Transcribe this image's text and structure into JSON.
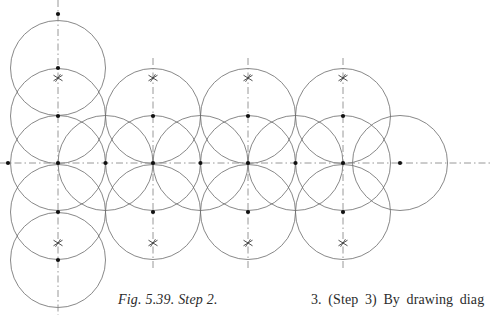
{
  "page": {
    "width": 491,
    "height": 322,
    "background": "#ffffff"
  },
  "figure": {
    "name": "compass-construction-hexagonal-circle-lattice",
    "caption": "Fig. 5.39. Step 2.",
    "stroke_color": "#6a6a6a",
    "construction_line_color": "#8c8c8c",
    "point_color": "#111111",
    "circle_radius": 47.5,
    "lattice": {
      "column_x": [
        58,
        105.5,
        153,
        200.5,
        248,
        295.5,
        343,
        400
      ],
      "row_y": [
        14,
        68,
        116,
        163,
        212,
        260,
        300
      ],
      "axis_y": 163,
      "col_spacing": 47.5,
      "row_spacing": 48
    },
    "circles": [
      {
        "cx": 58,
        "cy": 68,
        "r": 47.5
      },
      {
        "cx": 58,
        "cy": 116,
        "r": 47.5
      },
      {
        "cx": 58,
        "cy": 163,
        "r": 47.5
      },
      {
        "cx": 58,
        "cy": 212,
        "r": 47.5
      },
      {
        "cx": 58,
        "cy": 260,
        "r": 47.5
      },
      {
        "cx": 105.5,
        "cy": 163,
        "r": 47.5
      },
      {
        "cx": 153,
        "cy": 116,
        "r": 47.5
      },
      {
        "cx": 153,
        "cy": 163,
        "r": 47.5
      },
      {
        "cx": 153,
        "cy": 212,
        "r": 47.5
      },
      {
        "cx": 200.5,
        "cy": 163,
        "r": 47.5
      },
      {
        "cx": 248,
        "cy": 116,
        "r": 47.5
      },
      {
        "cx": 248,
        "cy": 163,
        "r": 47.5
      },
      {
        "cx": 248,
        "cy": 212,
        "r": 47.5
      },
      {
        "cx": 295.5,
        "cy": 163,
        "r": 47.5
      },
      {
        "cx": 343,
        "cy": 116,
        "r": 47.5
      },
      {
        "cx": 343,
        "cy": 163,
        "r": 47.5
      },
      {
        "cx": 343,
        "cy": 212,
        "r": 47.5
      },
      {
        "cx": 400,
        "cy": 163,
        "r": 47.5
      }
    ],
    "dash_dot_vertical_lines": [
      {
        "x": 58,
        "y1": 0,
        "y2": 315
      },
      {
        "x": 153,
        "y1": 58,
        "y2": 270
      },
      {
        "x": 248,
        "y1": 58,
        "y2": 270
      },
      {
        "x": 343,
        "y1": 58,
        "y2": 270
      }
    ],
    "dash_dot_horizontal_lines": [
      {
        "y": 163,
        "x1": 0,
        "x2": 491
      }
    ],
    "marked_points": [
      {
        "x": 58,
        "y": 14
      },
      {
        "x": 58,
        "y": 68
      },
      {
        "x": 58,
        "y": 116
      },
      {
        "x": 58,
        "y": 163
      },
      {
        "x": 58,
        "y": 212
      },
      {
        "x": 58,
        "y": 260
      },
      {
        "x": 153,
        "y": 116
      },
      {
        "x": 153,
        "y": 163
      },
      {
        "x": 153,
        "y": 212
      },
      {
        "x": 248,
        "y": 116
      },
      {
        "x": 248,
        "y": 163
      },
      {
        "x": 248,
        "y": 212
      },
      {
        "x": 343,
        "y": 116
      },
      {
        "x": 343,
        "y": 163
      },
      {
        "x": 343,
        "y": 212
      },
      {
        "x": 8,
        "y": 163
      },
      {
        "x": 105.5,
        "y": 163
      },
      {
        "x": 200.5,
        "y": 163
      },
      {
        "x": 295.5,
        "y": 163
      },
      {
        "x": 400,
        "y": 163
      }
    ],
    "cross_marks": [
      {
        "x": 58,
        "y": 78
      },
      {
        "x": 153,
        "y": 78
      },
      {
        "x": 248,
        "y": 78
      },
      {
        "x": 343,
        "y": 78
      },
      {
        "x": 58,
        "y": 243
      },
      {
        "x": 153,
        "y": 243
      },
      {
        "x": 248,
        "y": 243
      },
      {
        "x": 343,
        "y": 243
      }
    ]
  },
  "text": {
    "body_paragraph": "3. (Step 3) By drawing diag"
  }
}
